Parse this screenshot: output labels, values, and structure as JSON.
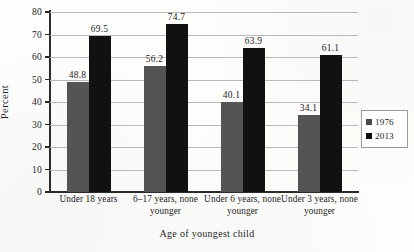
{
  "chart_data": {
    "type": "bar",
    "title": "",
    "xlabel": "Age of youngest child",
    "ylabel": "Percent",
    "ylim": [
      0,
      80
    ],
    "ytick_step": 10,
    "yticks": [
      "0",
      "10",
      "20",
      "30",
      "40",
      "50",
      "60",
      "70",
      "80"
    ],
    "grid": true,
    "legend_position": "right",
    "categories": [
      "Under 18 years",
      "6–17 years, none younger",
      "Under 6 years, none younger",
      "Under 3 years, none younger"
    ],
    "series": [
      {
        "name": "1976",
        "color": "#545454",
        "values": [
          48.8,
          56.2,
          40.1,
          34.1
        ]
      },
      {
        "name": "2013",
        "color": "#111111",
        "values": [
          69.5,
          74.7,
          63.9,
          61.1
        ]
      }
    ],
    "data_labels": [
      [
        "48.8",
        "56.2",
        "40.1",
        "34.1"
      ],
      [
        "69.5",
        "74.7",
        "63.9",
        "61.1"
      ]
    ]
  },
  "legend": {
    "items": [
      {
        "label": "1976",
        "swatch": "legend-swatch-1976"
      },
      {
        "label": "2013",
        "swatch": "legend-swatch-2013"
      }
    ]
  }
}
